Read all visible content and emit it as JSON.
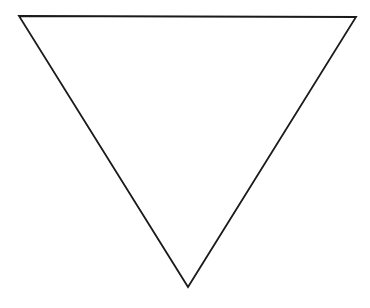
{
  "diagram": {
    "shape": "inverted-triangle",
    "stroke_color": "#1a1a1a",
    "fill_color": "#ffffff",
    "stroke_width": 1.8,
    "vertices": {
      "top_left": [
        19,
        16
      ],
      "top_right": [
        356,
        17
      ],
      "bottom": [
        188,
        287
      ]
    }
  }
}
